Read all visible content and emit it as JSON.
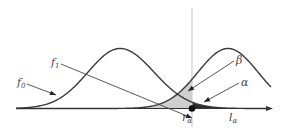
{
  "figure": {
    "curves": [
      {
        "id": "f0",
        "label": "f",
        "subscript": "0"
      },
      {
        "id": "f1",
        "label": "f",
        "subscript": "1"
      }
    ],
    "regions": [
      {
        "id": "beta",
        "label": "β",
        "color": "#cfcfcf"
      },
      {
        "id": "alpha",
        "label": "α",
        "color": "#2b2b2b"
      }
    ],
    "threshold": {
      "label": "r",
      "subscript": "α"
    },
    "interval": {
      "label": "l",
      "subscript": "α"
    },
    "colors": {
      "curve": "#3a3a3a",
      "axis": "#333333",
      "threshold_line": "#cfcfcf",
      "beta_fill": "#cfcfcf",
      "alpha_fill": "#2b2b2b",
      "label": "#444444"
    }
  }
}
